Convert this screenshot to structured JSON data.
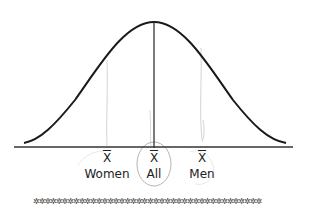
{
  "diagram": {
    "type": "normal-distribution",
    "curve_color": "#1a1a1a",
    "axis_color": "#333333",
    "mean_line_color": "#333333",
    "sketch_color": "#bbbbbb",
    "markers": [
      {
        "symbol": "X",
        "label": "Women",
        "x": 107
      },
      {
        "symbol": "X",
        "label": "All",
        "x": 154,
        "circled": true
      },
      {
        "symbol": "X",
        "label": "Men",
        "x": 202
      }
    ],
    "decorative_border": "✲✲✲✲✲✲✲✲✲✲✲✲✲✲✲✲✲✲✲✲✲✲✲✲✲✲✲✲✲✲✲✲✲✲✲✲✲✲✲✲"
  }
}
